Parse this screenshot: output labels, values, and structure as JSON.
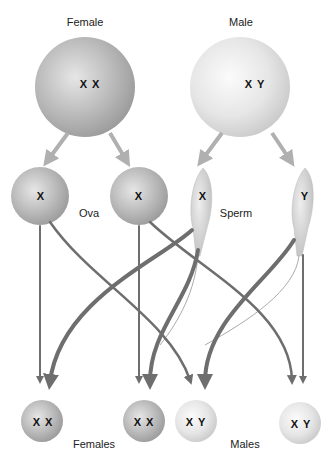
{
  "parents": {
    "female": {
      "label": "Female",
      "chromosomes": "X X"
    },
    "male": {
      "label": "Male",
      "chromosomes": "X Y"
    }
  },
  "gametes": {
    "ova_label": "Ova",
    "sperm_label": "Sperm",
    "ova": [
      {
        "chromosome": "X"
      },
      {
        "chromosome": "X"
      }
    ],
    "sperm": [
      {
        "chromosome": "X"
      },
      {
        "chromosome": "Y"
      }
    ]
  },
  "offspring": {
    "females_label": "Females",
    "males_label": "Males",
    "items": [
      {
        "chromosomes": "X X"
      },
      {
        "chromosomes": "X X"
      },
      {
        "chromosomes": "X Y"
      },
      {
        "chromosomes": "X Y"
      }
    ]
  },
  "colors": {
    "arrow": "#6e6e6e",
    "light_arrow": "#b0b0b0",
    "female_cell": "#b8b8b8",
    "male_cell": "#e8e8e8"
  }
}
